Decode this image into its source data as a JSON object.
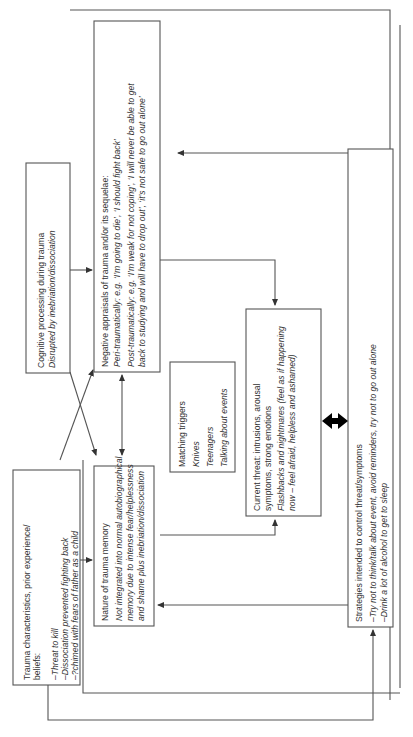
{
  "diagram": {
    "type": "flowchart",
    "orientation": "rotated-90-counterclockwise",
    "colors": {
      "line": "#555555",
      "text": "#333333",
      "background": "#ffffff",
      "bidirectional_arrow": "#000000"
    },
    "boxes": {
      "trauma_characteristics": {
        "title_line1": "Trauma characteristics, prior experience/",
        "title_line2": "beliefs:",
        "items": [
          "–Threat to kill",
          "–Dissociation prevented fighting back",
          "–?chimed with fears of father as a child"
        ]
      },
      "cognitive_processing": {
        "title": "Cognitive processing during trauma",
        "detail": "Disrupted by inebriation/dissociation"
      },
      "nature_of_memory": {
        "title": "Nature of trauma memory",
        "lines": [
          "Not integrated into normal autobiographical",
          "memory due to intense fear/helplessness",
          "and shame plus inebriation/dissociation"
        ]
      },
      "negative_appraisals": {
        "title": "Negative appraisals of trauma and/or its sequelae:",
        "lines": [
          "Peri-traumatically: e.g. ‘I’m going to die’, ‘I should fight back’",
          "Post-traumatically: e.g. ‘I’m weak for not coping’, ‘I will never be able to get",
          "back to studying and will have to drop out’, ‘it’s not safe to go out alone’"
        ]
      },
      "matching_triggers": {
        "title": "Matching triggers",
        "items": [
          "Knives",
          "Teenagers",
          "Talking about events"
        ]
      },
      "current_threat": {
        "title_line1": "Current threat: intrusions, arousal",
        "title_line2": "symptoms, strong emotions",
        "lines": [
          "Flashbacks and nightmares (feel as if happening",
          "now – feel afraid, helpless and ashamed)"
        ]
      },
      "strategies": {
        "title": "Strategies intended to control threat/symptoms",
        "items": [
          "–Try not to think/talk about event, avoid reminders, try not to go out alone",
          "–Drink a lot of alcohol to get to sleep"
        ]
      }
    },
    "connections": [
      {
        "from": "trauma_characteristics",
        "to": "negative_appraisals"
      },
      {
        "from": "trauma_characteristics",
        "to": "strategies"
      },
      {
        "from": "cognitive_processing",
        "to": "negative_appraisals"
      },
      {
        "from": "cognitive_processing",
        "to": "nature_of_memory"
      },
      {
        "from": "nature_of_memory",
        "to": "negative_appraisals",
        "bidirectional": true
      },
      {
        "from": "nature_of_memory",
        "to": "current_threat"
      },
      {
        "from": "negative_appraisals",
        "to": "current_threat"
      },
      {
        "from": "current_threat",
        "to": "strategies",
        "bidirectional": true,
        "bold": true
      },
      {
        "from": "strategies",
        "to": "negative_appraisals"
      },
      {
        "from": "strategies",
        "to": "nature_of_memory"
      }
    ]
  }
}
